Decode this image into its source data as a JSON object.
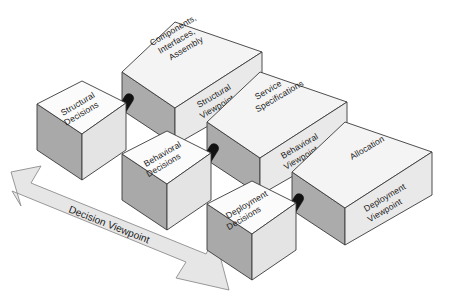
{
  "diagram": {
    "colors": {
      "top_face": "#f4f4f4",
      "front_face": "#e9e9e9",
      "side_face": "#ababab",
      "outline": "#3a3a3a",
      "arrow_fill": "#e6e6e6",
      "arrow_outline": "#8d8d8d",
      "pin": "#111111",
      "background": "#ffffff",
      "text": "#1a1a1a"
    },
    "decision_cubes": [
      {
        "id": "structural-decisions",
        "label_line1": "Structural",
        "label_line2": "Decisions"
      },
      {
        "id": "behavioral-decisions",
        "label_line1": "Behavioral",
        "label_line2": "Decisions"
      },
      {
        "id": "deployment-decisions",
        "label_line1": "Deployment",
        "label_line2": "Decisions"
      }
    ],
    "viewpoint_boxes": [
      {
        "id": "structural-viewpoint",
        "top_lines": [
          "Components,",
          "Interfaces,",
          "Assembly"
        ],
        "front_lines": [
          "Structural",
          "Viewpoint"
        ]
      },
      {
        "id": "behavioral-viewpoint",
        "top_lines": [
          "Service",
          "Specifications"
        ],
        "front_lines": [
          "Behavioral",
          "Viewpoint"
        ]
      },
      {
        "id": "deployment-viewpoint",
        "top_lines": [
          "Allocation"
        ],
        "front_lines": [
          "Deployment",
          "Viewpoint"
        ]
      }
    ],
    "arrow": {
      "label": "Decision Viewpoint",
      "kind": "double-headed-arrow"
    },
    "connectors": [
      {
        "id": "connector-structural"
      },
      {
        "id": "connector-behavioral"
      },
      {
        "id": "connector-deployment"
      }
    ]
  }
}
